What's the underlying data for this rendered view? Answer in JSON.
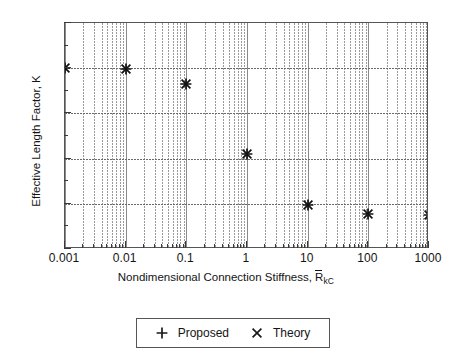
{
  "chart_data": {
    "type": "scatter",
    "title": "",
    "xlabel": "Nondimensional Connection Stiffness, R̄kC",
    "xlabel_text": "Nondimensional Connection Stiffness,",
    "xlabel_symbol": "R",
    "xlabel_subscript": "kC",
    "ylabel": "Effective Length Factor, K",
    "xscale": "log",
    "yscale": "linear",
    "xlim": [
      0.001,
      1000
    ],
    "ylim": [
      2.5,
      5
    ],
    "grid": true,
    "grid_minor": true,
    "legend_position": "below-center",
    "xticks": [
      0.001,
      0.01,
      0.1,
      1,
      10,
      100,
      1000
    ],
    "xtick_labels": [
      "0.001",
      "0.01",
      "0.1",
      "1",
      "10",
      "100",
      "1000"
    ],
    "yticks": [
      2.5,
      3,
      3.5,
      4,
      4.5,
      5
    ],
    "ytick_labels": [
      "2.5",
      "3",
      "3.5",
      "4",
      "4.5",
      "5"
    ],
    "series": [
      {
        "name": "Proposed",
        "marker": "plus",
        "x": [
          0.001,
          0.01,
          0.1,
          1,
          10,
          100,
          1000
        ],
        "y": [
          4.5,
          4.49,
          4.33,
          3.55,
          2.99,
          2.885,
          2.875
        ]
      },
      {
        "name": "Theory",
        "marker": "cross",
        "x": [
          0.001,
          0.01,
          0.1,
          1,
          10,
          100,
          1000
        ],
        "y": [
          4.5,
          4.49,
          4.33,
          3.55,
          2.99,
          2.885,
          2.875
        ]
      }
    ]
  },
  "legend": {
    "entries": [
      {
        "label": "Proposed",
        "symbol": "plus-marker"
      },
      {
        "label": "Theory",
        "symbol": "cross-marker"
      }
    ]
  }
}
